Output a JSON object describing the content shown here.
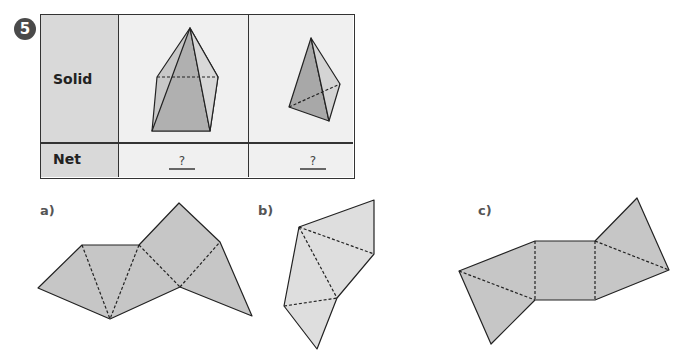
{
  "question_number": "5",
  "table": {
    "row_labels": {
      "solid": "Solid",
      "net": "Net"
    },
    "columns": [
      {
        "solid": "square-based pyramid",
        "net_answer": "?"
      },
      {
        "solid": "triangular pyramid (tetrahedron)",
        "net_answer": "?"
      }
    ]
  },
  "options": [
    {
      "label": "a)",
      "description": "net with four triangles and a pentagon-like fold"
    },
    {
      "label": "b)",
      "description": "net of four triangles"
    },
    {
      "label": "c)",
      "description": "net with a square and four triangles"
    }
  ],
  "colors": {
    "face": "#c6c6c6",
    "face_light": "#dedede",
    "face_dark": "#a9a9a9",
    "outline": "#222222",
    "header_bg": "#d9d9d9",
    "cell_bg": "#f0f0f0"
  }
}
